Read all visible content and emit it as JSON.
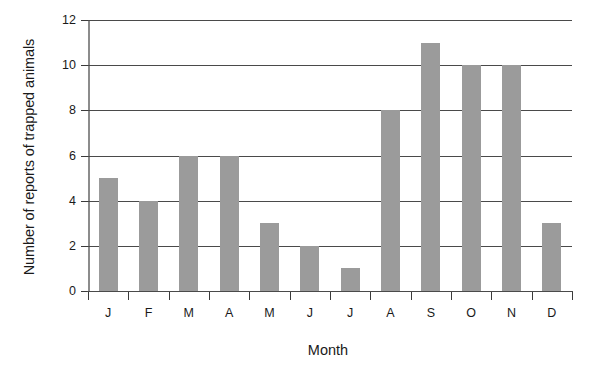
{
  "chart_data": {
    "type": "bar",
    "title": "",
    "subtitle": "",
    "xlabel": "Month",
    "ylabel": "Number of reports of trapped animals",
    "categories": [
      "J",
      "F",
      "M",
      "A",
      "M",
      "J",
      "J",
      "A",
      "S",
      "O",
      "N",
      "D"
    ],
    "values": [
      5,
      4,
      6,
      6,
      3,
      2,
      1,
      8,
      11,
      10,
      10,
      3
    ],
    "ylim": [
      0,
      12
    ],
    "y_ticks": [
      0,
      2,
      4,
      6,
      8,
      10,
      12
    ],
    "y_tick_labels": [
      "0",
      "2",
      "4",
      "6",
      "8",
      "10",
      "12"
    ],
    "grid": true,
    "grid_axis": "y",
    "legend": false,
    "legend_position": "none",
    "bar_color": "#9b9b9b",
    "grid_color": "#4a4a4a",
    "axis_color": "#3a3a3a",
    "background_color": "#ffffff"
  }
}
